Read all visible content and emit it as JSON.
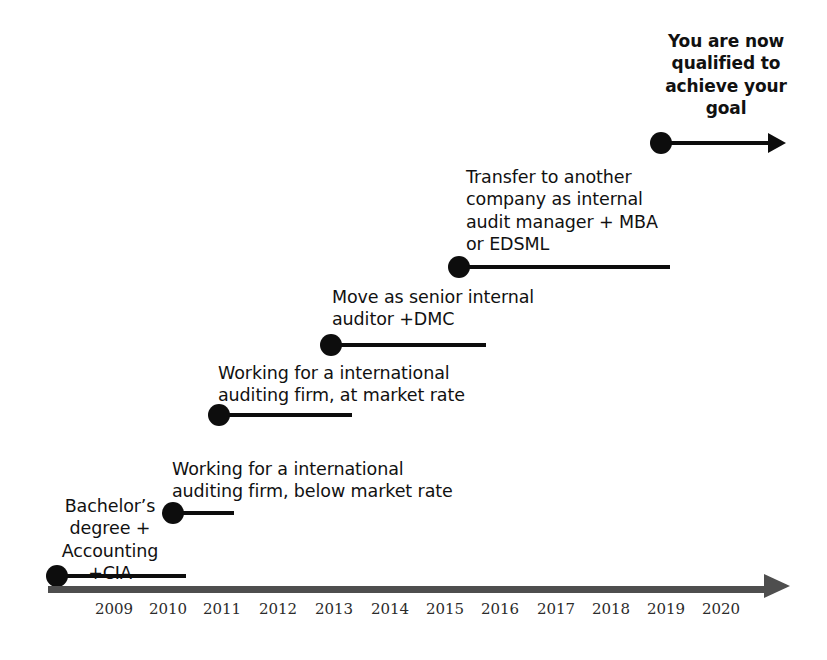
{
  "diagram": {
    "title_text": "Career progression timeline",
    "background_color": "#ffffff",
    "marker_color": "#0d0d0d",
    "axis_color": "#4e4e4e",
    "text_color": "#111111"
  },
  "milestones": [
    {
      "id": "bachelors-degree",
      "label": "Bachelor’s\ndegree  +\nAccounting\n+CIA",
      "align": "center",
      "year": "2009",
      "label_left": 40,
      "label_top": 495,
      "label_width": 140,
      "marker_left": 46,
      "marker_top": 565,
      "stem_start": 18,
      "stem_length": 122,
      "has_arrow_head": false
    },
    {
      "id": "intl-auditing-below-market",
      "label": "Working for a international\nauditing firm, below market rate",
      "align": "left",
      "year": "2011",
      "label_left": 172,
      "label_top": 458,
      "label_width": 330,
      "marker_left": 162,
      "marker_top": 502,
      "stem_start": 18,
      "stem_length": 54,
      "has_arrow_head": false
    },
    {
      "id": "intl-auditing-at-market",
      "label": "Working for a international\nauditing firm, at market rate",
      "align": "left",
      "year": "2012",
      "label_left": 218,
      "label_top": 362,
      "label_width": 310,
      "marker_left": 208,
      "marker_top": 404,
      "stem_start": 18,
      "stem_length": 126,
      "has_arrow_head": false
    },
    {
      "id": "senior-internal-auditor",
      "label": "Move as senior internal\nauditor  +DMC",
      "align": "left",
      "year": "2014",
      "label_left": 332,
      "label_top": 286,
      "label_width": 280,
      "marker_left": 320,
      "marker_top": 334,
      "stem_start": 18,
      "stem_length": 148,
      "has_arrow_head": false
    },
    {
      "id": "transfer-internal-audit-manager",
      "label": "Transfer to another\ncompany as internal\naudit manager + MBA\nor EDSML",
      "align": "left",
      "year": "2016",
      "label_left": 466,
      "label_top": 166,
      "label_width": 240,
      "marker_left": 448,
      "marker_top": 256,
      "stem_start": 18,
      "stem_length": 204,
      "has_arrow_head": false
    },
    {
      "id": "goal-qualified",
      "label": "You are now\nqualified to\nachieve your\ngoal",
      "align": "goal",
      "year": "2019",
      "label_left": 650,
      "label_top": 30,
      "label_width": 152,
      "marker_left": 650,
      "marker_top": 132,
      "stem_start": 18,
      "stem_length": 100,
      "has_arrow_head": true
    }
  ],
  "axis": {
    "name": "timeline-axis",
    "left": 48,
    "top": 586,
    "line_length": 716,
    "years": [
      {
        "label": "2009",
        "x": 66
      },
      {
        "label": "2010",
        "x": 120
      },
      {
        "label": "2011",
        "x": 174
      },
      {
        "label": "2012",
        "x": 230
      },
      {
        "label": "2013",
        "x": 286
      },
      {
        "label": "2014",
        "x": 342
      },
      {
        "label": "2015",
        "x": 397
      },
      {
        "label": "2016",
        "x": 452
      },
      {
        "label": "2017",
        "x": 508
      },
      {
        "label": "2018",
        "x": 563
      },
      {
        "label": "2019",
        "x": 618
      },
      {
        "label": "2020",
        "x": 673
      }
    ]
  }
}
